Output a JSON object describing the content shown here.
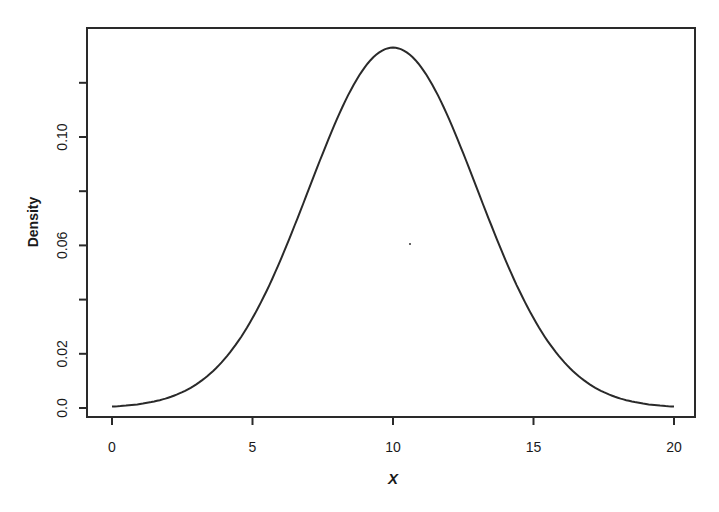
{
  "chart_data": {
    "type": "line",
    "title": "",
    "xlabel": "X",
    "ylabel": "Density",
    "xlim": [
      0,
      20
    ],
    "ylim": [
      0,
      0.135
    ],
    "grid": false,
    "legend": null,
    "x_ticks": [
      {
        "value": 0,
        "label": "0"
      },
      {
        "value": 5,
        "label": "5"
      },
      {
        "value": 10,
        "label": "10"
      },
      {
        "value": 15,
        "label": "15"
      },
      {
        "value": 20,
        "label": "20"
      }
    ],
    "y_ticks": [
      {
        "value": 0.0,
        "label": "0.0"
      },
      {
        "value": 0.02,
        "label": "0.02"
      },
      {
        "value": 0.04,
        "label": ""
      },
      {
        "value": 0.06,
        "label": "0.06"
      },
      {
        "value": 0.08,
        "label": ""
      },
      {
        "value": 0.1,
        "label": "0.10"
      },
      {
        "value": 0.12,
        "label": ""
      }
    ],
    "series": [
      {
        "name": "Normal density (mean 10, sd 3)",
        "x": [
          0,
          1,
          2,
          3,
          4,
          5,
          6,
          7,
          8,
          9,
          10,
          11,
          12,
          13,
          14,
          15,
          16,
          17,
          18,
          19,
          20
        ],
        "values": [
          0.0005,
          0.0015,
          0.0038,
          0.0087,
          0.018,
          0.0332,
          0.0547,
          0.0807,
          0.1065,
          0.1258,
          0.133,
          0.1258,
          0.1065,
          0.0807,
          0.0547,
          0.0332,
          0.018,
          0.0087,
          0.0038,
          0.0015,
          0.0005
        ]
      }
    ]
  },
  "colors": {
    "line": "#2a2a2a",
    "axis": "#2a2a2a",
    "background": "#ffffff"
  }
}
